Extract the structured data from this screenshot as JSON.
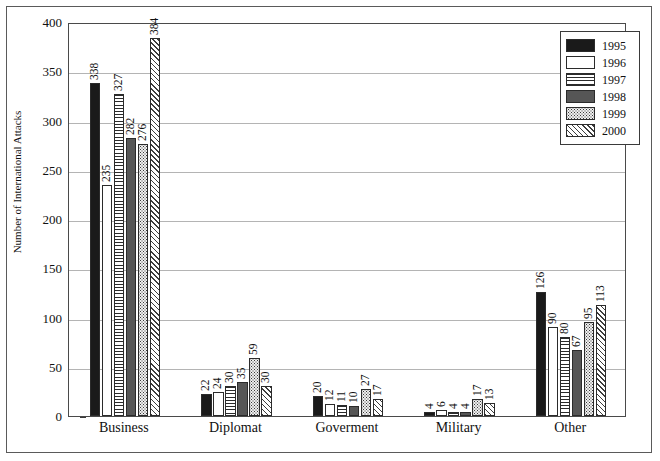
{
  "chart_data": {
    "type": "bar",
    "title": "",
    "xlabel": "",
    "ylabel": "Number of International Attacks",
    "ylim": [
      0,
      400
    ],
    "ytick_step": 50,
    "yticks": [
      0,
      50,
      100,
      150,
      200,
      250,
      300,
      350,
      400
    ],
    "grid": true,
    "legend_position": "top-right",
    "categories": [
      "Business",
      "Diplomat",
      "Goverment",
      "Military",
      "Other"
    ],
    "series": [
      {
        "name": "1995",
        "pattern": "solid-black",
        "values": [
          338,
          22,
          20,
          4,
          126
        ]
      },
      {
        "name": "1996",
        "pattern": "solid-white",
        "values": [
          235,
          24,
          12,
          6,
          90
        ]
      },
      {
        "name": "1997",
        "pattern": "horizontal-lines",
        "values": [
          327,
          30,
          11,
          4,
          80
        ]
      },
      {
        "name": "1998",
        "pattern": "solid-gray",
        "values": [
          282,
          35,
          10,
          4,
          67
        ]
      },
      {
        "name": "1999",
        "pattern": "dotted",
        "values": [
          276,
          59,
          27,
          17,
          95
        ]
      },
      {
        "name": "2000",
        "pattern": "diagonal-hatch",
        "values": [
          384,
          30,
          17,
          13,
          113
        ]
      }
    ]
  },
  "colors": {
    "1995": "#1a1a1a",
    "1996": "#ffffff",
    "1997": "#2b2b2b",
    "1998": "#565656",
    "1999": "#3a3a3a",
    "2000": "#3d3d3d",
    "gridline": "#b4b4b4",
    "axis": "#4a4a4a",
    "frame": "#5a5a5a",
    "text": "#111111"
  }
}
